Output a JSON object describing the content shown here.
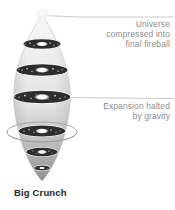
{
  "figure": {
    "caption": "Big Crunch",
    "type": "cosmology-schematic",
    "background_color": "#ffffff",
    "text_color": "#8d8d8d",
    "caption_color": "#262626",
    "cone_fill_top": "#f2f2f2",
    "cone_fill_bottom": "#9e9e9e",
    "galaxy_color": "#2b2b2b",
    "galaxy_core_color": "#ffffff",
    "leader_line_color": "#b0b0b0"
  },
  "annotations": [
    {
      "id": "universe-compressed",
      "lines": [
        "Universe",
        "compressed into",
        "final fireball"
      ],
      "align": "right",
      "leader_from": "cone-apex"
    },
    {
      "id": "expansion-halted",
      "lines": [
        "Expansion halted",
        "by gravity"
      ],
      "align": "right",
      "leader_from": "widest-galaxy-disk"
    }
  ],
  "cone": {
    "label": "time-cone-contracting",
    "apex_y": 14,
    "widest_y": 95,
    "tip_y": 181,
    "center_x": 42,
    "max_half_width": 29,
    "description": "funnel narrowing downward representing contracting universe"
  },
  "galaxy_disks": [
    {
      "index": 1,
      "cy": 44,
      "rx": 19,
      "ry": 5.0
    },
    {
      "index": 2,
      "cy": 70,
      "rx": 26,
      "ry": 6.0
    },
    {
      "index": 3,
      "cy": 97,
      "rx": 29,
      "ry": 6.5
    },
    {
      "index": 4,
      "cy": 131,
      "rx": 24,
      "ry": 5.6
    },
    {
      "index": 5,
      "cy": 152,
      "rx": 16,
      "ry": 4.4
    },
    {
      "index": 6,
      "cy": 168,
      "rx": 8,
      "ry": 3.0
    }
  ],
  "ring": {
    "label": "gravity-halo-ring",
    "cx": 42,
    "cy": 132,
    "rx": 35,
    "ry": 10
  }
}
